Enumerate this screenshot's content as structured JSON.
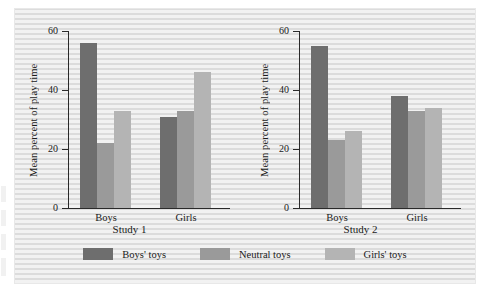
{
  "chart_data": {
    "type": "bar",
    "title": "",
    "xlabel": "",
    "ylabel": "Mean percent of play time",
    "ylim": [
      0,
      60
    ],
    "yticks": [
      0,
      20,
      40,
      60
    ],
    "ytick_labels": [
      "0",
      "20",
      "40",
      "60"
    ],
    "grid": false,
    "legend_position": "bottom-center",
    "legend": [
      "Boys' toys",
      "Neutral toys",
      "Girls' toys"
    ],
    "categories": [
      "Boys",
      "Girls"
    ],
    "panels": [
      {
        "label": "Study 1",
        "categories": [
          "Boys",
          "Girls"
        ],
        "series": [
          {
            "name": "Boys' toys",
            "values": [
              56,
              31
            ]
          },
          {
            "name": "Neutral toys",
            "values": [
              22,
              33
            ]
          },
          {
            "name": "Girls' toys",
            "values": [
              33,
              46
            ]
          }
        ]
      },
      {
        "label": "Study 2",
        "categories": [
          "Boys",
          "Girls"
        ],
        "series": [
          {
            "name": "Boys' toys",
            "values": [
              55,
              38
            ]
          },
          {
            "name": "Neutral toys",
            "values": [
              23,
              33
            ]
          },
          {
            "name": "Girls' toys",
            "values": [
              26,
              34
            ]
          }
        ]
      }
    ],
    "colors": {
      "boys_toys": "#6e6e6e",
      "neutral_toys": "#9a9a9a",
      "girls_toys": "#b4b4b4",
      "axis": "#2a2a2a",
      "background": "#e6e6e6"
    }
  }
}
